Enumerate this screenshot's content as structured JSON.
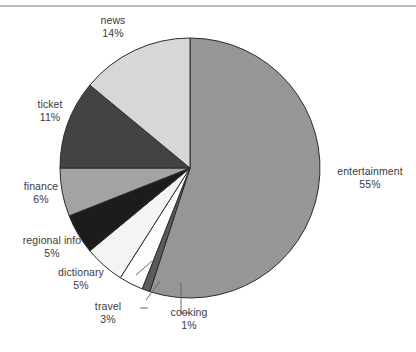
{
  "chart": {
    "title": "",
    "background_color": "#ffffff",
    "text_color": "#3a3a3a",
    "top_rule_color": "#b9bcc0"
  },
  "chart_data": {
    "type": "pie",
    "title": "",
    "xlabel": "",
    "ylabel": "",
    "legend_position": "none",
    "grid": false,
    "start_angle_deg": 0,
    "direction": "clockwise",
    "categories": [
      "entertainment",
      "cooking",
      "travel",
      "dictionary",
      "regional info",
      "finance",
      "ticket",
      "news"
    ],
    "values": [
      55,
      1,
      3,
      5,
      5,
      6,
      11,
      14
    ],
    "value_labels": [
      "55%",
      "1%",
      "3%",
      "5%",
      "5%",
      "6%",
      "11%",
      "14%"
    ],
    "unit": "%",
    "colors": [
      "#969696",
      "#5b5b5b",
      "#fdfdfd",
      "#f4f4f4",
      "#1c1c1c",
      "#a3a3a3",
      "#434343",
      "#d7d7d7"
    ],
    "slice_border_color": "#2b2b2b",
    "slices": [
      {
        "label": "entertainment",
        "value": 55,
        "value_label": "55%",
        "color": "#969696",
        "leader": false
      },
      {
        "label": "cooking",
        "value": 1,
        "value_label": "1%",
        "color": "#5b5b5b",
        "leader": true
      },
      {
        "label": "travel",
        "value": 3,
        "value_label": "3%",
        "color": "#fdfdfd",
        "leader": true
      },
      {
        "label": "dictionary",
        "value": 5,
        "value_label": "5%",
        "color": "#f4f4f4",
        "leader": true
      },
      {
        "label": "regional info",
        "value": 5,
        "value_label": "5%",
        "color": "#1c1c1c",
        "leader": false
      },
      {
        "label": "finance",
        "value": 6,
        "value_label": "6%",
        "color": "#a3a3a3",
        "leader": false
      },
      {
        "label": "ticket",
        "value": 11,
        "value_label": "11%",
        "color": "#434343",
        "leader": false
      },
      {
        "label": "news",
        "value": 14,
        "value_label": "14%",
        "color": "#d7d7d7",
        "leader": false
      }
    ]
  },
  "labels": {
    "news_name": "news",
    "news_value": "14%",
    "ticket_name": "ticket",
    "ticket_value": "11%",
    "finance_name": "finance",
    "finance_value": "6%",
    "regional_name": "regional info",
    "regional_value": "5%",
    "dictionary_name": "dictionary",
    "dictionary_value": "5%",
    "travel_name": "travel",
    "travel_value": "3%",
    "cooking_name": "cooking",
    "cooking_value": "1%",
    "entertainment_name": "entertainment",
    "entertainment_value": "55%"
  }
}
